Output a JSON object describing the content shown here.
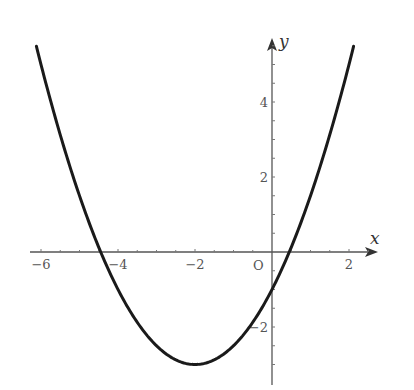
{
  "chart_data": {
    "type": "line",
    "title": "",
    "xlabel": "x",
    "ylabel": "y",
    "origin_label": "O",
    "function": "y = (1/2)(x + 2)^2 - 3",
    "vertex": [
      -2,
      -3
    ],
    "y_intercept": -1,
    "x_intercepts": [
      -4.449,
      0.449
    ],
    "xlim": [
      -6.5,
      2.8
    ],
    "ylim": [
      -3.4,
      5.9
    ],
    "x_ticks": [
      -6,
      -4,
      -2,
      2
    ],
    "x_tick_labels": [
      "-6",
      "-4",
      "-2",
      "2"
    ],
    "y_ticks": [
      4,
      2,
      -2
    ],
    "y_tick_labels": [
      "4",
      "2",
      "-2"
    ],
    "grid": false,
    "legend": null,
    "series": [
      {
        "name": "parabola",
        "x": [
          -6.12,
          -6,
          -5.5,
          -5,
          -4.5,
          -4,
          -3.5,
          -3,
          -2.5,
          -2,
          -1.5,
          -1,
          -0.5,
          0,
          0.5,
          1,
          1.5,
          2,
          2.12
        ],
        "y": [
          5.49,
          5.0,
          3.125,
          1.5,
          0.125,
          -1.0,
          -1.875,
          -2.5,
          -2.875,
          -3.0,
          -2.875,
          -2.5,
          -1.875,
          -1.0,
          0.125,
          1.5,
          3.125,
          5.0,
          5.49
        ]
      }
    ],
    "colors": {
      "curve": "#1a1a1a",
      "axes": "#555555",
      "text": "#555555"
    }
  }
}
